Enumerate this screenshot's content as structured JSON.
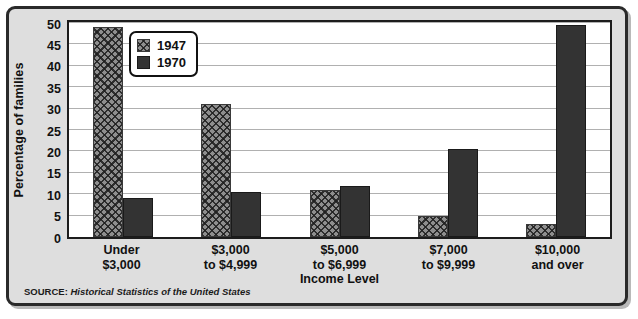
{
  "chart_data": {
    "type": "bar",
    "title": "",
    "xlabel": "Income Level",
    "ylabel": "Percentage of families",
    "categories": [
      {
        "line1": "Under",
        "line2": "$3,000"
      },
      {
        "line1": "$3,000",
        "line2": "to $4,999"
      },
      {
        "line1": "$5,000",
        "line2": "to $6,999"
      },
      {
        "line1": "$7,000",
        "line2": "to $9,999"
      },
      {
        "line1": "$10,000",
        "line2": "and over"
      }
    ],
    "series": [
      {
        "name": "1947",
        "values": [
          49,
          31,
          11,
          5,
          3
        ],
        "color": "#8e8e8e",
        "pattern": "crosshatch"
      },
      {
        "name": "1970",
        "values": [
          9,
          10.5,
          12,
          20.5,
          49.5
        ],
        "color": "#333333",
        "pattern": "solid"
      }
    ],
    "ylim": [
      0,
      50
    ],
    "yticks": [
      0,
      5,
      10,
      15,
      20,
      25,
      30,
      35,
      40,
      45,
      50
    ],
    "ytick_labels": [
      "0",
      "5",
      "10",
      "15",
      "20",
      "25",
      "30",
      "35",
      "40",
      "45",
      "50"
    ],
    "grid": true,
    "grid_axis": "y",
    "legend_position": "upper-left-inside"
  },
  "legend": {
    "items": [
      {
        "label": "1947"
      },
      {
        "label": "1970"
      }
    ]
  },
  "source": {
    "prefix": "SOURCE:",
    "title": "Historical Statistics of the United States"
  },
  "colors": {
    "frame_border": "#2a2a2a",
    "frame_background": "#dedede",
    "plot_background": "#ffffff",
    "plot_border": "#1c1c1c",
    "gridline": "#b0b0b0",
    "series_1947": "#8e8e8e",
    "series_1970": "#333333",
    "text": "#111111"
  }
}
